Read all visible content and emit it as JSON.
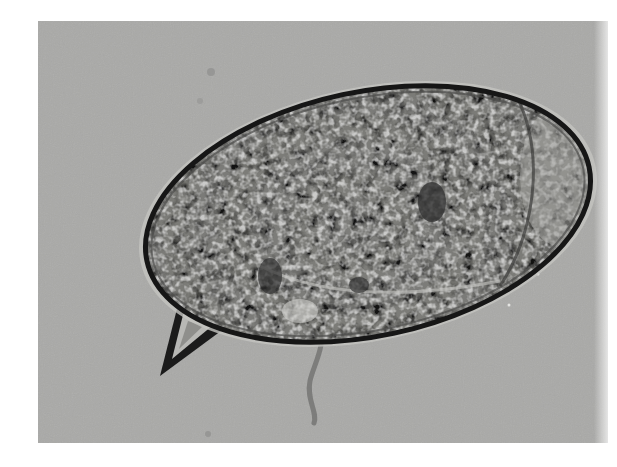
{
  "image": {
    "subject": "microscope micrograph of an oval parasite egg with a lateral spine",
    "style": "grayscale brightfield microscopy",
    "colors": {
      "background": "#ffffff",
      "field": "#a9a9a7",
      "egg_shell": "#1a1a1a",
      "egg_interior": "#7d7d7a",
      "highlight": "#d8d8d5"
    },
    "elements": [
      {
        "name": "egg",
        "shape": "ellipse"
      },
      {
        "name": "lateral-spine",
        "shape": "triangular spike, lower-left"
      },
      {
        "name": "fiber-debris",
        "shape": "thin wavy line below egg"
      }
    ]
  }
}
